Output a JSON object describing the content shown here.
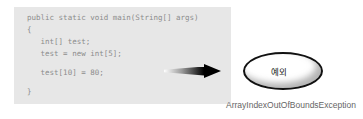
{
  "diagram": {
    "code": {
      "lines": [
        "public static void main(String[] args)",
        "{",
        "   int[] test;",
        "   test = new int[5];",
        "",
        "   test[10] = 80;",
        "",
        "}"
      ]
    },
    "exception_bubble": {
      "label": "예외"
    },
    "caption": "ArrayIndexOutOfBoundsException",
    "colors": {
      "code_background": "#e7e7e7",
      "code_text": "#8c8c8c",
      "arrow_gradient_start": "#ffffff",
      "arrow_gradient_end": "#000000",
      "bubble_fill": "#ffffff",
      "bubble_border": "#111111",
      "bubble_shadow": "#787878",
      "caption_text": "#666666"
    }
  }
}
